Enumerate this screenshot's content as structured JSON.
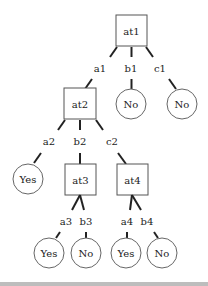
{
  "diagram": {
    "type": "decision-tree",
    "nodes": {
      "at1": {
        "label": "at1",
        "shape": "box"
      },
      "at2": {
        "label": "at2",
        "shape": "box"
      },
      "at3": {
        "label": "at3",
        "shape": "box"
      },
      "at4": {
        "label": "at4",
        "shape": "box"
      },
      "leaf_b1": {
        "label": "No",
        "shape": "circle"
      },
      "leaf_c1": {
        "label": "No",
        "shape": "circle"
      },
      "leaf_a2": {
        "label": "Yes",
        "shape": "circle"
      },
      "leaf_a3": {
        "label": "Yes",
        "shape": "circle"
      },
      "leaf_b3": {
        "label": "No",
        "shape": "circle"
      },
      "leaf_a4": {
        "label": "Yes",
        "shape": "circle"
      },
      "leaf_b4": {
        "label": "No",
        "shape": "circle"
      }
    },
    "edges": {
      "a1": {
        "label": "a1",
        "from": "at1",
        "to": "at2"
      },
      "b1": {
        "label": "b1",
        "from": "at1",
        "to": "leaf_b1"
      },
      "c1": {
        "label": "c1",
        "from": "at1",
        "to": "leaf_c1"
      },
      "a2": {
        "label": "a2",
        "from": "at2",
        "to": "leaf_a2"
      },
      "b2": {
        "label": "b2",
        "from": "at2",
        "to": "at3"
      },
      "c2": {
        "label": "c2",
        "from": "at2",
        "to": "at4"
      },
      "a3": {
        "label": "a3",
        "from": "at3",
        "to": "leaf_a3"
      },
      "b3": {
        "label": "b3",
        "from": "at3",
        "to": "leaf_b3"
      },
      "a4": {
        "label": "a4",
        "from": "at4",
        "to": "leaf_a4"
      },
      "b4": {
        "label": "b4",
        "from": "at4",
        "to": "leaf_b4"
      }
    }
  }
}
